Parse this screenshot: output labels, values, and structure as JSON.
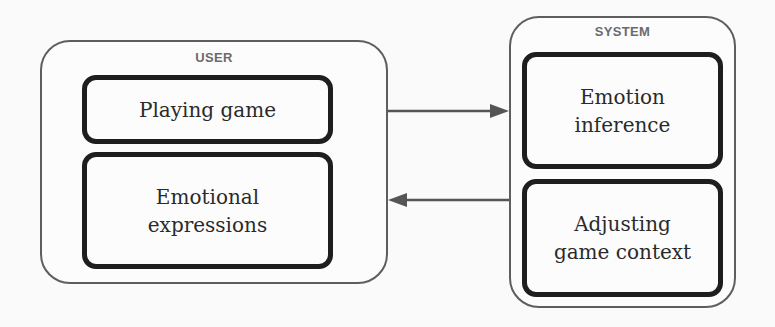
{
  "diagram": {
    "user": {
      "label": "USER",
      "boxes": [
        {
          "lines": [
            "Playing game"
          ]
        },
        {
          "lines": [
            "Emotional",
            "expressions"
          ]
        }
      ]
    },
    "system": {
      "label": "SYSTEM",
      "boxes": [
        {
          "lines": [
            "Emotion",
            "inference"
          ]
        },
        {
          "lines": [
            "Adjusting",
            "game context"
          ]
        }
      ]
    },
    "arrows": [
      {
        "from": "user",
        "to": "system",
        "description": "user-to-system"
      },
      {
        "from": "system",
        "to": "user",
        "description": "system-to-user"
      }
    ],
    "colors": {
      "outer_border": "#5e5e5e",
      "inner_border": "#1e1e1e",
      "label": "#6b6b6b",
      "arrow": "#555555"
    }
  }
}
